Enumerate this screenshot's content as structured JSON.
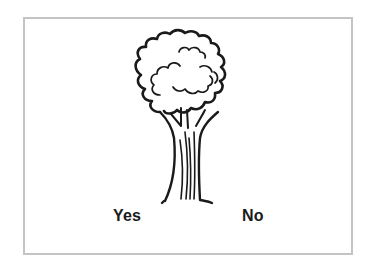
{
  "card": {
    "image": "tree-illustration",
    "options": [
      {
        "label": "Yes"
      },
      {
        "label": "No"
      }
    ]
  },
  "colors": {
    "border": "#c4c4c4",
    "ink": "#1a1a1a",
    "background": "#ffffff"
  }
}
